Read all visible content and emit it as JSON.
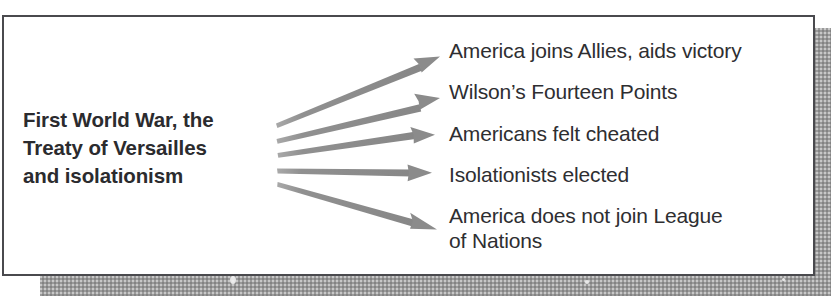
{
  "diagram": {
    "type": "fan-out-flow",
    "source": {
      "lines": [
        "First World War, the",
        "Treaty of Versailles",
        "and isolationism"
      ],
      "text": "First World War, the Treaty of Versailles and isolationism",
      "emphasis": "bold"
    },
    "arrow": {
      "count": 5,
      "direction": "left-to-right",
      "color": "#8b8b8b",
      "style": "solid-tapered-with-triangular-head"
    },
    "outcomes": [
      {
        "id": "outcome-1",
        "text": "America joins Allies, aids victory"
      },
      {
        "id": "outcome-2",
        "text": "Wilson’s Fourteen Points"
      },
      {
        "id": "outcome-3",
        "text": "Americans felt cheated"
      },
      {
        "id": "outcome-4",
        "text": "Isolationists elected"
      },
      {
        "id": "outcome-5",
        "text": "America does not join League\nof Nations"
      }
    ]
  },
  "colors": {
    "frame_border": "#4a4a4e",
    "page_background": "#ffffff",
    "text": "#2e2e31",
    "source_text": "#2b2b2e",
    "arrow": "#8b8b8b",
    "shadow_plate": "#9a9a9a"
  }
}
